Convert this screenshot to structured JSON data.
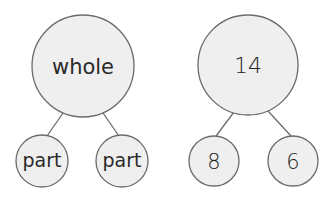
{
  "diagrams": [
    {
      "name": "generic-number-bond",
      "whole": {
        "label": "whole",
        "cx": 83,
        "cy": 66,
        "r": 51
      },
      "parts": [
        {
          "label": "part",
          "cx": 42,
          "cy": 161,
          "r": 26
        },
        {
          "label": "part",
          "cx": 122,
          "cy": 161,
          "r": 26
        }
      ]
    },
    {
      "name": "numeric-number-bond",
      "whole": {
        "label": "14",
        "cx": 248,
        "cy": 65,
        "r": 50
      },
      "parts": [
        {
          "label": "8",
          "cx": 214,
          "cy": 161,
          "r": 25
        },
        {
          "label": "6",
          "cx": 293,
          "cy": 161,
          "r": 25
        }
      ]
    }
  ],
  "colors": {
    "fill": "#efefef",
    "stroke": "#6b6b6b",
    "text": "#2a2a2a"
  }
}
